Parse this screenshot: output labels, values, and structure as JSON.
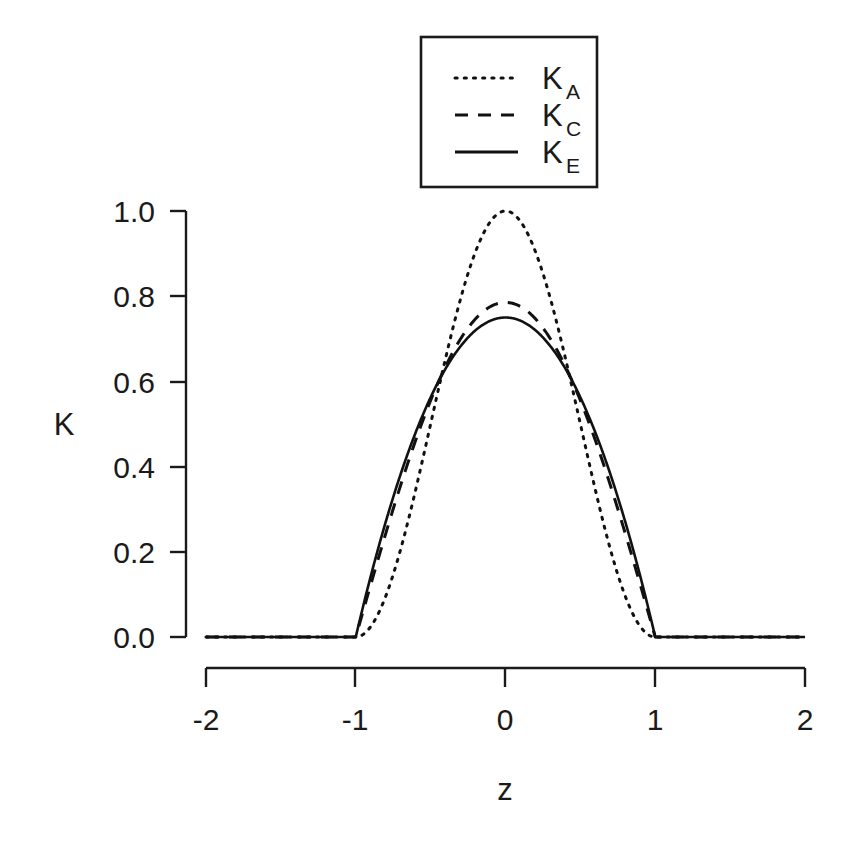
{
  "figure": {
    "background_color": "#ffffff",
    "line_color": "#111111",
    "width": 853,
    "height": 854
  },
  "axes": {
    "x_title": "z",
    "y_title": "K",
    "x_ticks": [
      "-2",
      "-1",
      "0",
      "1",
      "2"
    ],
    "y_ticks": [
      "0.0",
      "0.2",
      "0.4",
      "0.6",
      "0.8",
      "1.0"
    ]
  },
  "legend": {
    "entries": [
      {
        "label_main": "K",
        "label_sub": "A",
        "style": "dotted"
      },
      {
        "label_main": "K",
        "label_sub": "C",
        "style": "dashed"
      },
      {
        "label_main": "K",
        "label_sub": "E",
        "style": "solid"
      }
    ]
  },
  "chart_data": {
    "type": "line",
    "title": "",
    "xlabel": "z",
    "ylabel": "K",
    "xlim": [
      -2,
      2
    ],
    "ylim": [
      0.0,
      1.0
    ],
    "xticks": [
      -2,
      -1,
      0,
      1,
      2
    ],
    "yticks": [
      0.0,
      0.2,
      0.4,
      0.6,
      0.8,
      1.0
    ],
    "grid": false,
    "legend_position": "top-center",
    "x": [
      -2.0,
      -1.8,
      -1.6,
      -1.4,
      -1.2,
      -1.0,
      -0.95,
      -0.9,
      -0.85,
      -0.8,
      -0.75,
      -0.7,
      -0.65,
      -0.6,
      -0.55,
      -0.5,
      -0.45,
      -0.4,
      -0.35,
      -0.3,
      -0.25,
      -0.2,
      -0.15,
      -0.1,
      -0.05,
      0.0,
      0.05,
      0.1,
      0.15,
      0.2,
      0.25,
      0.3,
      0.35,
      0.4,
      0.45,
      0.5,
      0.55,
      0.6,
      0.65,
      0.7,
      0.75,
      0.8,
      0.85,
      0.9,
      0.95,
      1.0,
      1.2,
      1.4,
      1.6,
      1.8,
      2.0
    ],
    "series": [
      {
        "name": "K_A",
        "style": "dotted",
        "formula": "cos^2(pi*z/2), |z| <= 1",
        "values": [
          0.0,
          0.0,
          0.0,
          0.0,
          0.0,
          0.0,
          0.006,
          0.024,
          0.054,
          0.095,
          0.146,
          0.206,
          0.272,
          0.345,
          0.421,
          0.5,
          0.579,
          0.655,
          0.728,
          0.794,
          0.854,
          0.905,
          0.946,
          0.976,
          0.994,
          1.0,
          0.994,
          0.976,
          0.946,
          0.905,
          0.854,
          0.794,
          0.728,
          0.655,
          0.579,
          0.5,
          0.421,
          0.345,
          0.272,
          0.206,
          0.146,
          0.095,
          0.054,
          0.024,
          0.006,
          0.0,
          0.0,
          0.0,
          0.0,
          0.0,
          0.0
        ]
      },
      {
        "name": "K_C",
        "style": "dashed",
        "formula": "(pi/4)*cos(pi*z/2), |z| <= 1",
        "values": [
          0.0,
          0.0,
          0.0,
          0.0,
          0.0,
          0.0,
          0.062,
          0.123,
          0.184,
          0.243,
          0.3,
          0.356,
          0.409,
          0.461,
          0.509,
          0.555,
          0.598,
          0.638,
          0.674,
          0.706,
          0.735,
          0.759,
          0.78,
          0.795,
          0.807,
          0.785,
          0.807,
          0.795,
          0.78,
          0.759,
          0.735,
          0.706,
          0.674,
          0.638,
          0.598,
          0.555,
          0.509,
          0.461,
          0.409,
          0.356,
          0.3,
          0.243,
          0.184,
          0.123,
          0.062,
          0.0,
          0.0,
          0.0,
          0.0,
          0.0,
          0.0
        ]
      },
      {
        "name": "K_E",
        "style": "solid",
        "formula": "0.75*(1 - z^2), |z| <= 1",
        "values": [
          0.0,
          0.0,
          0.0,
          0.0,
          0.0,
          0.0,
          0.073,
          0.143,
          0.208,
          0.27,
          0.328,
          0.383,
          0.433,
          0.48,
          0.523,
          0.563,
          0.598,
          0.63,
          0.658,
          0.683,
          0.703,
          0.72,
          0.733,
          0.743,
          0.748,
          0.75,
          0.748,
          0.743,
          0.733,
          0.72,
          0.703,
          0.683,
          0.658,
          0.63,
          0.598,
          0.563,
          0.523,
          0.48,
          0.433,
          0.383,
          0.328,
          0.27,
          0.208,
          0.143,
          0.073,
          0.0,
          0.0,
          0.0,
          0.0,
          0.0,
          0.0
        ]
      }
    ],
    "peaks": {
      "K_A": 1.0,
      "K_C": 0.785,
      "K_E": 0.75
    },
    "support": [
      -1,
      1
    ]
  }
}
